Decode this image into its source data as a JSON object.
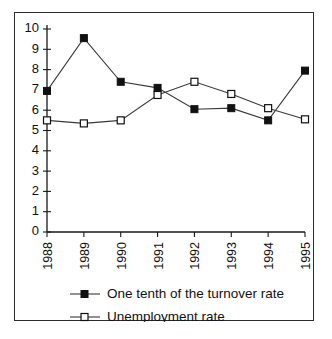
{
  "chart_data": {
    "type": "line",
    "title": "",
    "subtitle": "",
    "xlabel": "",
    "ylabel": "",
    "categories": [
      "1988",
      "1989",
      "1990",
      "1991",
      "1992",
      "1993",
      "1994",
      "1995"
    ],
    "x_tick_labels": [
      "1988",
      "1989",
      "1990",
      "1991",
      "1992",
      "1993",
      "1994",
      "1995"
    ],
    "x_tick_rotation": -90,
    "y_tick_labels": [
      "0",
      "1",
      "2",
      "3",
      "4",
      "5",
      "6",
      "7",
      "8",
      "9",
      "10"
    ],
    "ylim": [
      0,
      10
    ],
    "y_ticks": [
      0,
      1,
      2,
      3,
      4,
      5,
      6,
      7,
      8,
      9,
      10
    ],
    "grid": false,
    "legend_position": "bottom-left",
    "series": [
      {
        "name": "One tenth of the turnover rate",
        "marker": "filled-square",
        "color": "#111111",
        "values": [
          6.95,
          9.55,
          7.4,
          7.1,
          6.05,
          6.1,
          5.5,
          7.95
        ]
      },
      {
        "name": "Unemployment rate",
        "marker": "open-square",
        "color": "#ffffff",
        "values": [
          5.5,
          5.35,
          5.5,
          6.75,
          7.4,
          6.8,
          6.1,
          5.55
        ]
      }
    ],
    "legend": [
      {
        "label": "One tenth of the turnover rate",
        "marker": "filled-square"
      },
      {
        "label": "Unemployment rate",
        "marker": "open-square"
      }
    ],
    "colors": {
      "axis": "#1a1a1a",
      "line": "#3a3a3a",
      "frame": "#2b2b2b",
      "background": "#ffffff"
    }
  }
}
